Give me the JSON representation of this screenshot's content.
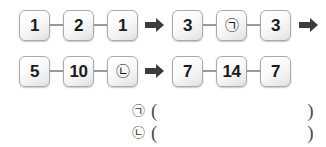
{
  "worksheet": {
    "rows": [
      {
        "id": "row-1",
        "left_group": [
          "1",
          "2",
          "1"
        ],
        "right_group": [
          "3",
          "㉠",
          "3"
        ],
        "arrow_middle": "right-arrow",
        "arrow_trailing": "right-arrow",
        "has_trailing_arrow": true
      },
      {
        "id": "row-2",
        "left_group": [
          "5",
          "10",
          "㉡"
        ],
        "right_group": [
          "7",
          "14",
          "7"
        ],
        "arrow_middle": "right-arrow",
        "arrow_trailing": "",
        "has_trailing_arrow": false
      }
    ],
    "answers": [
      {
        "marker": "㉠",
        "paren_open": "(",
        "value": "",
        "paren_close": ")"
      },
      {
        "marker": "㉡",
        "paren_open": "(",
        "value": "",
        "paren_close": ")"
      }
    ],
    "colors": {
      "box_border": "#a9a9a9",
      "box_fill_top": "#ffffff",
      "box_fill_bottom": "#dedede",
      "text": "#1b1b1b",
      "connector": "#9a9a9a",
      "arrow": "#3c3c3c",
      "background": "#ffffff"
    }
  }
}
